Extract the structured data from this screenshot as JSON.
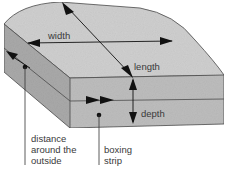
{
  "diagram": {
    "labels": {
      "width": "width",
      "length": "length",
      "depth": "depth",
      "distance_line1": "distance",
      "distance_line2": "around the",
      "distance_line3": "outside",
      "boxing_line1": "boxing",
      "boxing_line2": "strip"
    },
    "colors": {
      "top": "#cfcfcf",
      "front": "#bdbdbd",
      "side": "#a9a9a9",
      "edge": "#4a4a4a",
      "arrow": "#111111",
      "text": "#3a3a3a"
    }
  }
}
